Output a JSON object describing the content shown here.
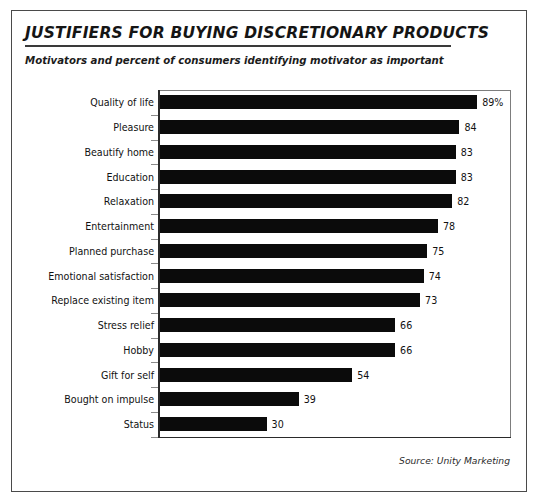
{
  "figure": {
    "title": "JUSTIFIERS FOR BUYING DISCRETIONARY PRODUCTS",
    "subtitle": "Motivators and percent of consumers identifying motivator as important",
    "source": "Source: Unity Marketing",
    "bar_color": "#0b0b0b",
    "frame_color": "#7d7d7d",
    "border_color": "#4a4a4a",
    "background": "#ffffff",
    "text_color": "#111111"
  },
  "chart_data": {
    "type": "bar",
    "orientation": "horizontal",
    "title": "JUSTIFIERS FOR BUYING DISCRETIONARY PRODUCTS",
    "subtitle": "Motivators and percent of consumers identifying motivator as important",
    "xlabel": "",
    "ylabel": "",
    "xlim": [
      0,
      100
    ],
    "grid": false,
    "legend": false,
    "source": "Source: Unity Marketing",
    "categories": [
      "Quality of life",
      "Pleasure",
      "Beautify home",
      "Education",
      "Relaxation",
      "Entertainment",
      "Planned purchase",
      "Emotional satisfaction",
      "Replace existing item",
      "Stress relief",
      "Hobby",
      "Gift for self",
      "Bought on impulse",
      "Status"
    ],
    "values": [
      89,
      84,
      83,
      83,
      82,
      78,
      75,
      74,
      73,
      66,
      66,
      54,
      39,
      30
    ],
    "data_labels": [
      "89%",
      "84",
      "83",
      "83",
      "82",
      "78",
      "75",
      "74",
      "73",
      "66",
      "66",
      "54",
      "39",
      "30"
    ],
    "bars": [
      {
        "label": "Quality of life",
        "value": 89,
        "display": "89%"
      },
      {
        "label": "Pleasure",
        "value": 84,
        "display": "84"
      },
      {
        "label": "Beautify home",
        "value": 83,
        "display": "83"
      },
      {
        "label": "Education",
        "value": 83,
        "display": "83"
      },
      {
        "label": "Relaxation",
        "value": 82,
        "display": "82"
      },
      {
        "label": "Entertainment",
        "value": 78,
        "display": "78"
      },
      {
        "label": "Planned purchase",
        "value": 75,
        "display": "75"
      },
      {
        "label": "Emotional satisfaction",
        "value": 74,
        "display": "74"
      },
      {
        "label": "Replace existing item",
        "value": 73,
        "display": "73"
      },
      {
        "label": "Stress relief",
        "value": 66,
        "display": "66"
      },
      {
        "label": "Hobby",
        "value": 66,
        "display": "66"
      },
      {
        "label": "Gift for self",
        "value": 54,
        "display": "54"
      },
      {
        "label": "Bought on impulse",
        "value": 39,
        "display": "39"
      },
      {
        "label": "Status",
        "value": 30,
        "display": "30"
      }
    ]
  }
}
